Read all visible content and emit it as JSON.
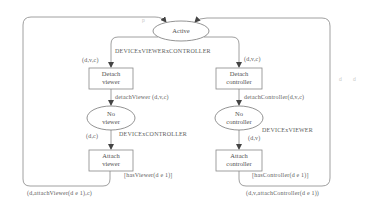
{
  "diagram": {
    "type": "petri-net",
    "colors": {
      "line": "#777777",
      "text": "#555555",
      "background": "#ffffff"
    },
    "places": [
      {
        "id": "active",
        "label": "Active"
      },
      {
        "id": "no_viewer",
        "label_lines": [
          "No",
          "viewer"
        ]
      },
      {
        "id": "no_controller",
        "label_lines": [
          "No",
          "controller"
        ]
      }
    ],
    "transitions": [
      {
        "id": "detach_viewer",
        "label_lines": [
          "Detach",
          "viewer"
        ]
      },
      {
        "id": "detach_controller",
        "label_lines": [
          "Detach",
          "controller"
        ]
      },
      {
        "id": "attach_viewer",
        "label_lines": [
          "Attach",
          "viewer"
        ]
      },
      {
        "id": "attach_controller",
        "label_lines": [
          "Attach",
          "controller"
        ]
      }
    ],
    "arc_labels": {
      "active_colorset": "DEVICExVIEWERxCONTROLLER",
      "active_to_detach_viewer": "(d,v,c)",
      "active_to_detach_controller": "(d,v,c)",
      "detach_viewer_out": "detachViewer (d,v,c)",
      "detach_controller_out": "detachController(d,v,c)",
      "no_viewer_colorset": "DEVICExCONTROLLER",
      "no_controller_colorset": "DEVICExVIEWER",
      "no_viewer_to_attach_viewer": "(d,c)",
      "no_controller_to_attach_controller": "(d,v)",
      "attach_viewer_guard": "[hasViewer(d e 1)]",
      "attach_controller_guard": "[hasController(d e 1)]",
      "attach_viewer_return": "(d,attachViewer(d e 1),c)",
      "attach_controller_return": "(d,v,attachController(d e 1))"
    },
    "marks": {
      "top_mark": "p",
      "right_mark_1": "d",
      "right_mark_2": "d"
    }
  }
}
